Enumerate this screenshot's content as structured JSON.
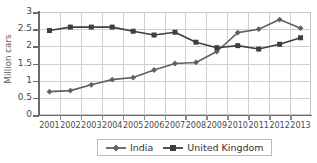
{
  "chart_data": {
    "type": "line",
    "title": "",
    "xlabel": "",
    "ylabel": "Million cars",
    "ylim": [
      0,
      3
    ],
    "ytick_step": 0.5,
    "ytick_labels": [
      "3",
      "2.5",
      "2",
      "1.5",
      "1",
      "0.5",
      "0"
    ],
    "grid": true,
    "legend_position": "bottom",
    "categories": [
      "2001",
      "2002",
      "2003",
      "2004",
      "2005",
      "2006",
      "2007",
      "2008",
      "2009",
      "2010",
      "2011",
      "2012",
      "2013"
    ],
    "series": [
      {
        "name": "India",
        "marker": "diamond",
        "color": "#606060",
        "values": [
          0.68,
          0.71,
          0.88,
          1.03,
          1.09,
          1.31,
          1.5,
          1.53,
          1.85,
          2.4,
          2.5,
          2.78,
          2.53
        ]
      },
      {
        "name": "United Kingdom",
        "marker": "square",
        "color": "#3f3f3f",
        "values": [
          2.46,
          2.56,
          2.56,
          2.56,
          2.44,
          2.33,
          2.41,
          2.12,
          1.96,
          2.02,
          1.92,
          2.06,
          2.25
        ]
      }
    ]
  },
  "legend": {
    "entries": [
      {
        "label": "India"
      },
      {
        "label": "United Kingdom"
      }
    ]
  },
  "colors": {
    "india": "#606060",
    "united_kingdom": "#3f3f3f",
    "grid": "#cfcfcf",
    "axis": "#6b6b6b",
    "text": "#4a4a4a"
  }
}
